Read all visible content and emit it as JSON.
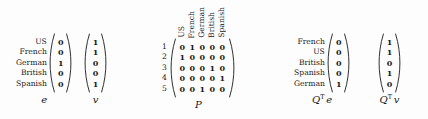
{
  "figure": {
    "background_color": "#fdfdfd",
    "text_color": "#1a1a1a"
  },
  "blocks": [
    {
      "id": "e",
      "caption": "e",
      "caption_plain": "e",
      "row_labels": [
        "US",
        "French",
        "German",
        "British",
        "Spanish"
      ],
      "values": [
        [
          0
        ],
        [
          0
        ],
        [
          1
        ],
        [
          0
        ],
        [
          0
        ]
      ]
    },
    {
      "id": "v",
      "caption": "v",
      "caption_plain": "v",
      "row_labels": [],
      "values": [
        [
          1
        ],
        [
          1
        ],
        [
          0
        ],
        [
          0
        ],
        [
          1
        ]
      ]
    },
    {
      "id": "P",
      "caption": "P",
      "caption_plain": "P",
      "row_numbers": [
        "1",
        "2",
        "3",
        "4",
        "5"
      ],
      "column_labels": [
        "US",
        "French",
        "German",
        "British",
        "Spanish"
      ],
      "values": [
        [
          0,
          1,
          0,
          0,
          0
        ],
        [
          1,
          0,
          0,
          0,
          0
        ],
        [
          0,
          0,
          0,
          1,
          0
        ],
        [
          0,
          0,
          0,
          0,
          1
        ],
        [
          0,
          0,
          1,
          0,
          0
        ]
      ]
    },
    {
      "id": "QTe",
      "caption_base": "Q",
      "caption_sup": "T",
      "caption_operand": "e",
      "caption_plain": "Qᵀ e",
      "row_labels": [
        "French",
        "US",
        "British",
        "Spanish",
        "German"
      ],
      "values": [
        [
          0
        ],
        [
          0
        ],
        [
          0
        ],
        [
          0
        ],
        [
          1
        ]
      ]
    },
    {
      "id": "QTv",
      "caption_base": "Q",
      "caption_sup": "T",
      "caption_operand": "v",
      "caption_plain": "Qᵀ v",
      "row_labels": [],
      "values": [
        [
          1
        ],
        [
          1
        ],
        [
          0
        ],
        [
          1
        ],
        [
          0
        ]
      ]
    }
  ]
}
